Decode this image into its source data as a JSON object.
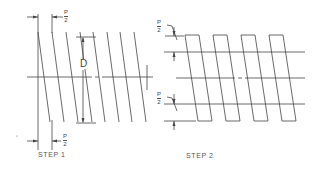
{
  "figure": {
    "colors": {
      "stroke": "#444444",
      "background": "#ffffff",
      "text": "#555555"
    },
    "step1": {
      "label": "STEP 1",
      "dimension_label": "D",
      "pitch_label_num": "P",
      "pitch_label_den": "2",
      "thread_lines_top_x": [
        38,
        52,
        66,
        80,
        93,
        107,
        120,
        134
      ],
      "thread_slant_px": 12
    },
    "step2": {
      "label": "STEP 2",
      "pitch_label_num": "P",
      "pitch_label_den": "2",
      "teeth_count": 4
    }
  }
}
